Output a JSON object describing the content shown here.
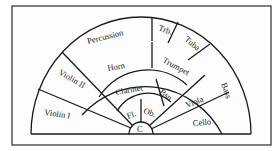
{
  "diagram": {
    "type": "orchestra-seating-chart",
    "sections": {
      "violin_1": "Violin I",
      "violin_2": "Violin II",
      "percussion": "Percussion",
      "horn": "Horn",
      "clarinet": "Clarinet",
      "flute": "Fl.",
      "oboe": "Ob.",
      "bassoon": "Bsn.",
      "trumpet": "Trumpet",
      "trombone": "Trb.",
      "tuba": "Tuba",
      "viola": "Viola",
      "cello": "Cello",
      "bass": "Bass",
      "conductor": "C"
    }
  }
}
